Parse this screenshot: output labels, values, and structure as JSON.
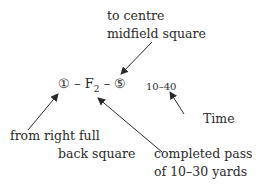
{
  "diagram": {
    "formula": {
      "from_square": "①",
      "separator": " – ",
      "action": "F",
      "action_subscript": "2",
      "to_square": "⑤"
    },
    "time_value": "10–40",
    "annotations": {
      "to_square": [
        "to centre",
        "midfield square"
      ],
      "from_square": [
        "from right full",
        "back square"
      ],
      "action": [
        "completed pass",
        "of 10–30 yards"
      ],
      "time": "Time"
    },
    "colors": {
      "text": "#2a2a2a",
      "arrow": "#2a2a2a",
      "background": "#ffffff"
    }
  }
}
